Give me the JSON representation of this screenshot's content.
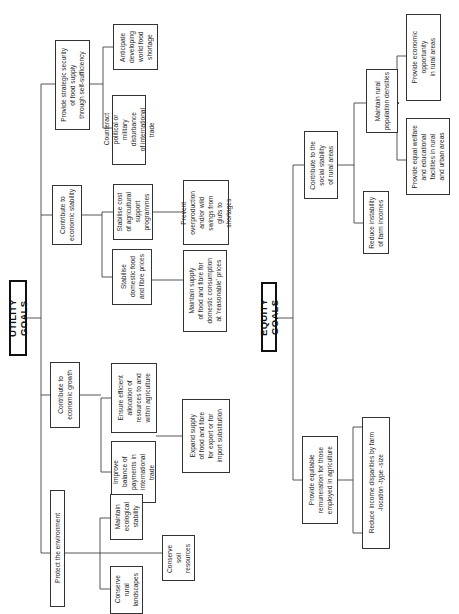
{
  "utility": {
    "title": "UTILITY GOALS",
    "branches": [
      {
        "label": "Provide strategic security\nof food supply\nthrough self-sufficiency",
        "children": [
          {
            "label": "Counteract\npolitical or\nmilitary\ndisturbance\nof international\ntrade"
          },
          {
            "label": "Anticipate\ndeveloping\nworld food\nshortage"
          }
        ]
      },
      {
        "label": "Contribute to\neconomic stability",
        "children": [
          {
            "label": "Stabilise cost\nof agricultural\nsupport\nprogrammes",
            "children": [
              {
                "label": "Prevent\noverproduction\nand/or wild\nswings from\ngluts to\nshortages"
              }
            ]
          },
          {
            "label": "Stabilise\ndomestic food\nand fibre prices",
            "children": [
              {
                "label": "Maintain supply\nof food and fibre for\ndomestic consumption\nat 'reasonable' prices"
              }
            ]
          }
        ]
      },
      {
        "label": "Contribute to\neconomic growth",
        "children": [
          {
            "label": "Ensure efficient\nallocation of\nresources to and\nwithin agriculture"
          },
          {
            "label": "Improve\nbalance of\npayments in\ninternational\ntrade",
            "children": [
              {
                "label": "Expand supply\nof food and fibre\nfor export or for\nimport substitution"
              }
            ]
          }
        ]
      },
      {
        "label": "Protect the environment",
        "children": [
          {
            "label": "Maintain\necological\nstability"
          },
          {
            "label": "Conserve\nsoil\nresources"
          },
          {
            "label": "Conserve\nrural\nlandscapes"
          }
        ]
      }
    ]
  },
  "equity": {
    "title": "EQUITY GOALS",
    "branches": [
      {
        "label": "Contribute to the\nsocial stability\nof rural areas",
        "children": [
          {
            "label": "Maintain rural\npopulation densities",
            "children": [
              {
                "label": "Provide economic\nopportunity\nin rural areas"
              },
              {
                "label": "Provide equal welfare\nand educational\nfacilities in rural\nand urban areas"
              }
            ]
          },
          {
            "label": "Reduce instability\nof farm incomes"
          }
        ]
      },
      {
        "label": "Provide equitable\nremuneration for those\nemployed in agriculture",
        "children": [
          {
            "label": "Reduce income disparities by farm\n-location            -type            -size"
          }
        ]
      }
    ]
  }
}
